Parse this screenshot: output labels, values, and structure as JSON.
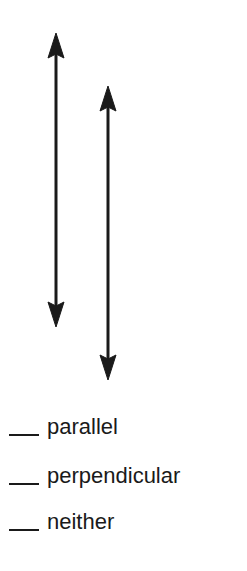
{
  "figure": {
    "lines": [
      {
        "name": "line-a",
        "x": 56,
        "y_top": 33,
        "y_bottom": 327
      },
      {
        "name": "line-b",
        "x": 108,
        "y_top": 86,
        "y_bottom": 380
      }
    ],
    "color": "#1a1a1a"
  },
  "options": [
    {
      "label": "parallel"
    },
    {
      "label": "perpendicular"
    },
    {
      "label": "neither"
    }
  ]
}
